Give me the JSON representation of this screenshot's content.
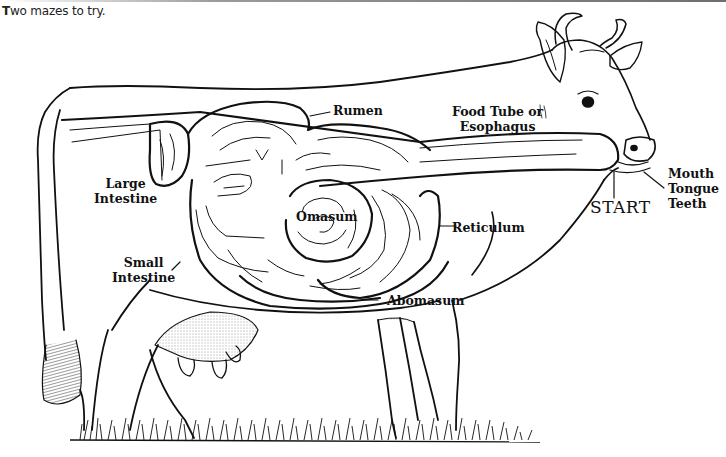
{
  "caption": "Two mazes to try.",
  "diagram": {
    "labels": {
      "rumen": "Rumen",
      "food_tube": [
        "Food Tube or",
        "Esophagus"
      ],
      "mouth": [
        "Mouth",
        "Tongue",
        "Teeth"
      ],
      "start": "START",
      "large_intestine": [
        "Large",
        "Intestine"
      ],
      "small_intestine": [
        "Small",
        "Intestine"
      ],
      "omasum": "Omasum",
      "reticulum": "Reticulum",
      "abomasum": "Abomasum"
    },
    "colors": {
      "ink": "#111111",
      "paper": "#ffffff"
    }
  }
}
